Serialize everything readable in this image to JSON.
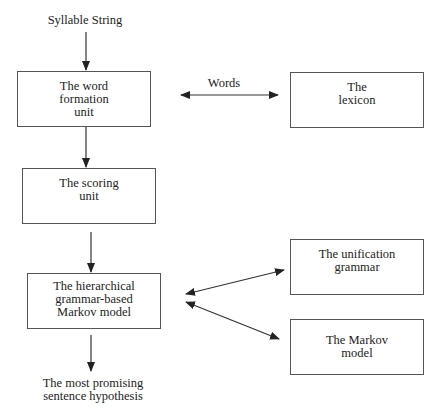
{
  "diagram": {
    "input_label": "Syllable String",
    "output_label": "The most promising\nsentence  hypothesis",
    "edge_label_words": "Words",
    "nodes": {
      "word_formation": "The word\nformation\nunit",
      "lexicon": "The\nlexicon",
      "scoring": "The scoring\nunit",
      "hierarchical": "The hierarchical\ngrammar-based\nMarkov model",
      "unification": "The unification\ngrammar",
      "markov": "The Markov\nmodel"
    },
    "edges": [
      {
        "from": "Syllable String",
        "to": "The word formation unit",
        "type": "directed"
      },
      {
        "from": "The word formation unit",
        "to": "The lexicon",
        "label": "Words",
        "type": "bidirectional"
      },
      {
        "from": "The word formation unit",
        "to": "The scoring unit",
        "type": "directed"
      },
      {
        "from": "The scoring unit",
        "to": "The hierarchical grammar-based Markov model",
        "type": "directed"
      },
      {
        "from": "The hierarchical grammar-based Markov model",
        "to": "The unification grammar",
        "type": "bidirectional"
      },
      {
        "from": "The hierarchical grammar-based Markov model",
        "to": "The Markov model",
        "type": "bidirectional"
      },
      {
        "from": "The hierarchical grammar-based Markov model",
        "to": "The most promising sentence hypothesis",
        "type": "directed"
      }
    ]
  }
}
